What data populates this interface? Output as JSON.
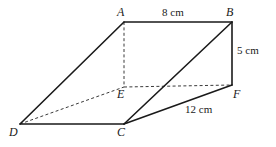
{
  "figure": {
    "kind": "oblique-triangular-prism-diagram",
    "background_color": "#ffffff",
    "stroke_color": "#1a1a1a",
    "solid_stroke_width": 1.6,
    "dashed_stroke_width": 1.0,
    "dash_pattern": "3,2.4",
    "vertices": {
      "A": {
        "label": "A",
        "x": 124,
        "y": 22
      },
      "B": {
        "label": "B",
        "x": 232,
        "y": 22
      },
      "C": {
        "label": "C",
        "x": 124,
        "y": 124
      },
      "D": {
        "label": "D",
        "x": 20,
        "y": 124
      },
      "E": {
        "label": "E",
        "x": 124,
        "y": 87
      },
      "F": {
        "label": "F",
        "x": 232,
        "y": 85
      }
    },
    "solid_edges": [
      {
        "name": "edge-A-B",
        "from": "A",
        "to": "B"
      },
      {
        "name": "edge-B-F",
        "from": "B",
        "to": "F"
      },
      {
        "name": "edge-B-C",
        "from": "B",
        "to": "C"
      },
      {
        "name": "edge-C-F",
        "from": "C",
        "to": "F"
      },
      {
        "name": "edge-A-D",
        "from": "A",
        "to": "D"
      },
      {
        "name": "edge-D-C",
        "from": "D",
        "to": "C"
      }
    ],
    "dashed_edges": [
      {
        "name": "edge-A-E",
        "from": "A",
        "to": "E"
      },
      {
        "name": "edge-E-F",
        "from": "E",
        "to": "F"
      },
      {
        "name": "edge-D-E",
        "from": "D",
        "to": "E"
      }
    ],
    "measurements": [
      {
        "name": "length-ab",
        "text": "8 cm",
        "edge": "A-B",
        "value": 8,
        "unit": "cm"
      },
      {
        "name": "length-bf",
        "text": "5 cm",
        "edge": "B-F",
        "value": 5,
        "unit": "cm"
      },
      {
        "name": "length-cf",
        "text": "12 cm",
        "edge": "C-F",
        "value": 12,
        "unit": "cm"
      }
    ]
  }
}
